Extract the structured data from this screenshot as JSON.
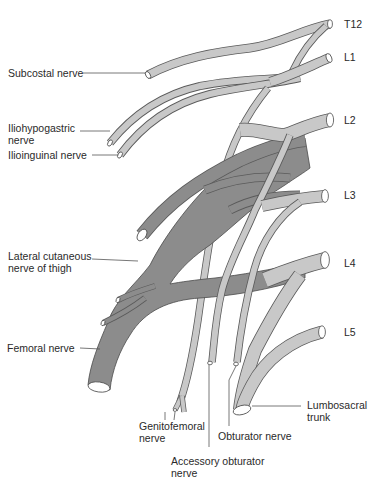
{
  "diagram": {
    "colors": {
      "light_nerve": "#c8c8c8",
      "dark_nerve": "#8c8c8c",
      "outline": "#4a4a4a",
      "background": "#ffffff",
      "text": "#2a2a2a"
    },
    "root_labels": [
      {
        "id": "t12",
        "text": "T12"
      },
      {
        "id": "l1",
        "text": "L1"
      },
      {
        "id": "l2",
        "text": "L2"
      },
      {
        "id": "l3",
        "text": "L3"
      },
      {
        "id": "l4",
        "text": "L4"
      },
      {
        "id": "l5",
        "text": "L5"
      }
    ],
    "nerve_labels": [
      {
        "id": "subcostal",
        "text": "Subcostal nerve"
      },
      {
        "id": "iliohypogastric",
        "text": "Iliohypogastric\nnerve"
      },
      {
        "id": "ilioinguinal",
        "text": "Ilioinguinal nerve"
      },
      {
        "id": "lateral_cutaneous",
        "text": "Lateral cutaneous\nnerve of thigh"
      },
      {
        "id": "femoral",
        "text": "Femoral nerve"
      },
      {
        "id": "genitofemoral",
        "text": "Genitofemoral\nnerve"
      },
      {
        "id": "accessory_obturator",
        "text": "Accessory obturator\nnerve"
      },
      {
        "id": "obturator",
        "text": "Obturator nerve"
      },
      {
        "id": "lumbosacral",
        "text": "Lumbosacral\ntrunk"
      }
    ]
  }
}
